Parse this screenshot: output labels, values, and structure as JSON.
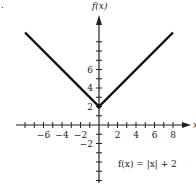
{
  "chart_data": {
    "type": "line",
    "title": "",
    "function_label": "f(x) = |x| + 2",
    "xlabel": "x",
    "ylabel": "f(x)",
    "xlim": [
      -8,
      8
    ],
    "ylim": [
      -6,
      10
    ],
    "x_tick_labels": [
      "−6",
      "−4",
      "−2",
      "2",
      "4",
      "6",
      "8"
    ],
    "x_tick_values": [
      -6,
      -4,
      -2,
      2,
      4,
      6,
      8
    ],
    "y_tick_labels": [
      "−2",
      "2",
      "4",
      "6"
    ],
    "y_tick_values": [
      -2,
      2,
      4,
      6
    ],
    "grid": false,
    "series": [
      {
        "name": "f(x) = |x| + 2",
        "x": [
          -8,
          0,
          8
        ],
        "y": [
          10,
          2,
          10
        ],
        "color": "#111111"
      }
    ],
    "vertex": {
      "x": 0,
      "y": 2
    },
    "marker": "."
  }
}
